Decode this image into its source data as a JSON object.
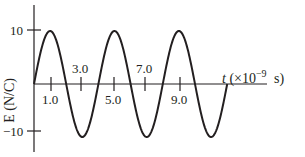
{
  "chart_data": {
    "type": "line",
    "title": "",
    "xlabel": "t (×10^-9 s)",
    "ylabel": "E (N/C)",
    "x_ticks": [
      "1.0",
      "3.0",
      "5.0",
      "7.0",
      "9.0"
    ],
    "y_ticks": [
      "10",
      "-10"
    ],
    "xlim": [
      0,
      14.5
    ],
    "ylim": [
      -10,
      10
    ],
    "grid": false,
    "legend": null,
    "series": [
      {
        "name": "E(t)",
        "function": "10*sin(2*pi*t/4)",
        "period": 4.0,
        "amplitude": 10,
        "x": [
          0,
          1,
          2,
          3,
          4,
          5,
          6,
          7,
          8,
          9,
          10,
          11,
          12
        ],
        "values": [
          0,
          10,
          0,
          -10,
          0,
          10,
          0,
          -10,
          0,
          10,
          0,
          -10,
          0
        ]
      }
    ]
  },
  "labels": {
    "y_axis": "E (N/C)",
    "x_axis_t": "t",
    "x_axis_unit": "(×10",
    "x_axis_exp": "−9",
    "x_axis_s": "s)",
    "y_tick_pos": "10",
    "y_tick_neg": "−10",
    "x_tick_1": "1.0",
    "x_tick_3": "3.0",
    "x_tick_5": "5.0",
    "x_tick_7": "7.0",
    "x_tick_9": "9.0"
  }
}
